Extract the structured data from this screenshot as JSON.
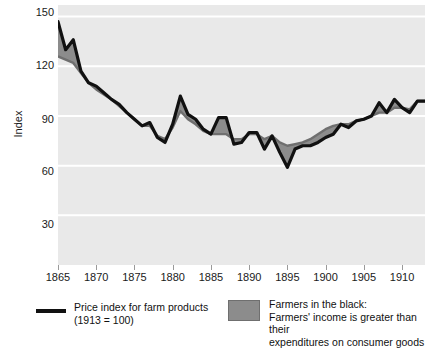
{
  "chart_data": {
    "type": "area",
    "title": "",
    "subtitle": "",
    "xlabel": "",
    "ylabel": "Index",
    "xlim": [
      1865,
      1913
    ],
    "ylim": [
      0,
      157
    ],
    "grid": true,
    "grid_axis": "y",
    "legend_position": "bottom",
    "yticks": [
      30,
      60,
      90,
      120,
      150
    ],
    "xticks": [
      1865,
      1870,
      1875,
      1880,
      1885,
      1890,
      1895,
      1900,
      1905,
      1910
    ],
    "x": [
      1865,
      1866,
      1867,
      1868,
      1869,
      1870,
      1871,
      1872,
      1873,
      1874,
      1875,
      1876,
      1877,
      1878,
      1879,
      1880,
      1881,
      1882,
      1883,
      1884,
      1885,
      1886,
      1887,
      1888,
      1889,
      1890,
      1891,
      1892,
      1893,
      1894,
      1895,
      1896,
      1897,
      1898,
      1899,
      1900,
      1901,
      1902,
      1903,
      1904,
      1905,
      1906,
      1907,
      1908,
      1909,
      1910,
      1911,
      1912,
      1913
    ],
    "series": [
      {
        "name": "Price index for farm products (1913 = 100)",
        "color": "#111111",
        "style": "line",
        "values": [
          147,
          130,
          136,
          117,
          110,
          108,
          104,
          100,
          97,
          92,
          88,
          84,
          86,
          77,
          74,
          85,
          102,
          91,
          88,
          82,
          79,
          89,
          89,
          73,
          74,
          80,
          80,
          70,
          78,
          68,
          59,
          70,
          72,
          72,
          74,
          77,
          79,
          85,
          83,
          87,
          88,
          90,
          98,
          92,
          100,
          95,
          92,
          99,
          99
        ]
      },
      {
        "name": "Index of prices paid by farmers for consumer goods",
        "color": "#6f6f6f",
        "style": "band-upper",
        "values": [
          126,
          124,
          122,
          116,
          110,
          106,
          103,
          100,
          96,
          92,
          88,
          84,
          84,
          78,
          76,
          83,
          93,
          88,
          85,
          81,
          79,
          79,
          79,
          76,
          76,
          79,
          79,
          76,
          78,
          74,
          72,
          73,
          74,
          76,
          79,
          82,
          84,
          85,
          85,
          87,
          88,
          90,
          92,
          92,
          95,
          95,
          94,
          99,
          99
        ]
      }
    ],
    "band": {
      "label": "Farmers in the black:\nFarmers' income is greater than their\nexpenditures on consumer goods",
      "fill_color": "#8c8c8c",
      "stroke_color": "#6f6f6f"
    },
    "plot_background": "#e9e9e9",
    "gridline_color": "#ffffff"
  },
  "legend": {
    "items": [
      {
        "swatch": "line",
        "label": "Price index for farm products\n(1913 = 100)"
      },
      {
        "swatch": "box",
        "label": "Farmers in the black:\nFarmers' income is greater than their\nexpenditures on consumer goods"
      }
    ]
  },
  "axes": {
    "ylabel": "Index",
    "ytick_labels": [
      "150",
      "120",
      "90",
      "60",
      "30"
    ],
    "xtick_labels": [
      "1865",
      "1870",
      "1875",
      "1880",
      "1885",
      "1890",
      "1895",
      "1900",
      "1905",
      "1910"
    ]
  }
}
